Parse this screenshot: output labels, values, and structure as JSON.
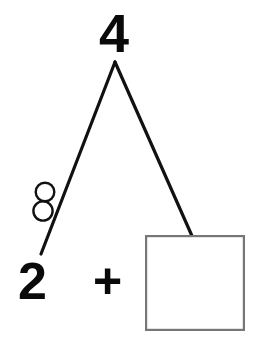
{
  "worksheet": {
    "type": "number-bond-decomposition",
    "background_color": "#ffffff",
    "whole": {
      "label": "4",
      "value": 4,
      "color": "#0a0a0a",
      "position": {
        "x": 115,
        "y": 33
      }
    },
    "equation": {
      "known_addend": "2",
      "operator": "+",
      "unknown_addend": "",
      "answer_box_empty": true,
      "full_text": "2 + "
    },
    "parts": [
      {
        "name": "left-part",
        "label": "2",
        "value": 2,
        "color": "#0a0a0a",
        "counters": 2,
        "counter_shape": "circle",
        "counter_fill": "none",
        "counter_stroke": "#111111"
      },
      {
        "name": "right-part",
        "label": "",
        "value": null,
        "answer_box": true,
        "box_stroke": "#777777",
        "box_fill": "#ffffff"
      }
    ],
    "branches": {
      "stroke_color": "#111111",
      "stroke_width": 3.2,
      "apex": {
        "x": 115,
        "y": 62
      },
      "left_end": {
        "x": 41,
        "y": 254
      },
      "right_end": {
        "x": 192,
        "y": 236
      }
    },
    "counters": [
      {
        "cx": 45,
        "cy": 192,
        "r": 9.3
      },
      {
        "cx": 43,
        "cy": 211,
        "r": 9.6
      }
    ],
    "answer_box": {
      "x": 145,
      "y": 235,
      "width": 99,
      "height": 95,
      "stroke": "#777777",
      "stroke_width": 2.2,
      "fill": "#ffffff"
    }
  }
}
